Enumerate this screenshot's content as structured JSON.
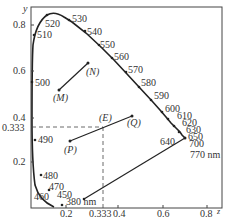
{
  "diagram": {
    "y_axis_label": "y",
    "x_axis_label": "z",
    "y_ticks": [
      "0.8",
      "0.6",
      "0.4",
      "0.333",
      "0.2"
    ],
    "x_ticks": [
      "0.2",
      "0.333",
      "0.4",
      "0.6",
      "0.8"
    ],
    "wavelength_labels": [
      "520",
      "530",
      "540",
      "550",
      "560",
      "570",
      "580",
      "590",
      "600",
      "610",
      "620",
      "630",
      "650",
      "700",
      "640",
      "510",
      "500",
      "490",
      "480",
      "470",
      "450",
      "460",
      "380 nm",
      "770 nm"
    ],
    "points": {
      "M": "(M)",
      "N": "(N)",
      "E": "(E)",
      "P": "(P)",
      "Q": "(Q)"
    }
  }
}
